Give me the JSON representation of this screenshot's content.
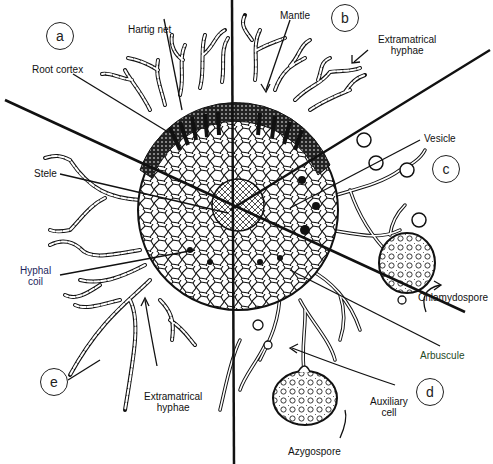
{
  "figure": {
    "sections": [
      {
        "id": "a",
        "label": "a"
      },
      {
        "id": "b",
        "label": "b"
      },
      {
        "id": "c",
        "label": "c"
      },
      {
        "id": "d",
        "label": "d"
      },
      {
        "id": "e",
        "label": "e"
      }
    ],
    "labels": {
      "hartig_net": "Hartig net",
      "mantle": "Mantle",
      "extramatrical_hyphae_top_1": "Extramatrical",
      "extramatrical_hyphae_top_2": "hyphae",
      "root_cortex": "Root cortex",
      "vesicle": "Vesicle",
      "stele": "Stele",
      "hyphal_coil_1": "Hyphal",
      "hyphal_coil_2": "coil",
      "chlamydospore": "Chlamydospore",
      "arbuscule": "Arbuscule",
      "auxiliary_cell_1": "Auxiliary",
      "auxiliary_cell_2": "cell",
      "extramatrical_hyphae_bottom_1": "Extramatrical",
      "extramatrical_hyphae_bottom_2": "hyphae",
      "azygospore": "Azygospore"
    },
    "colors": {
      "ink": "#111111",
      "hyphal_coil_label": "#1c1f5c",
      "arbuscule_label": "#1f4a1f",
      "background": "#ffffff"
    }
  }
}
